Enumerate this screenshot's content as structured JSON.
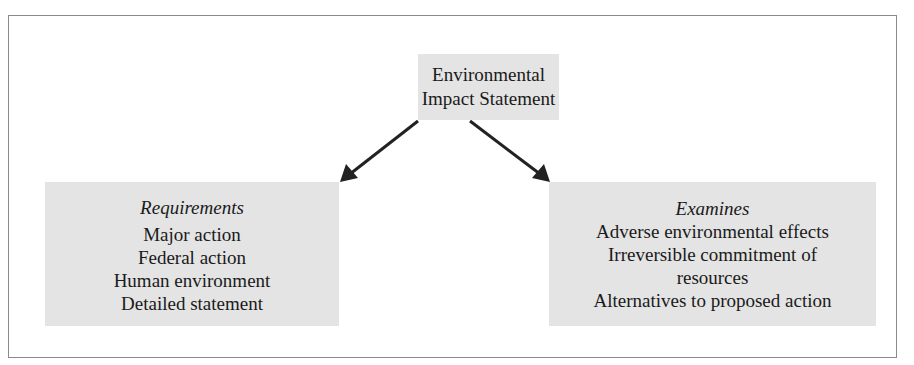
{
  "diagram": {
    "top": {
      "lines": [
        "Environmental",
        "Impact Statement"
      ]
    },
    "left": {
      "heading": "Requirements",
      "items": [
        "Major action",
        "Federal action",
        "Human environment",
        "Detailed statement"
      ]
    },
    "right": {
      "heading": "Examines",
      "items": [
        "Adverse environmental effects",
        "Irreversible commitment of",
        "resources",
        "Alternatives to proposed action"
      ]
    },
    "colors": {
      "box_fill": "#e4e4e4",
      "arrow": "#222222",
      "frame": "#8a8a8a"
    }
  }
}
